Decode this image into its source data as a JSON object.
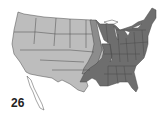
{
  "map": {
    "label": "26",
    "region": "Contiguous United States",
    "legend_colors": {
      "highlighted": "#6e6e6e",
      "partial": "#8c8c8c",
      "base": "#bdbdbd",
      "outline": "#4a4a4a",
      "background": "#ffffff"
    },
    "highlighted_region": "Eastern United States (Minnesota, Wisconsin, Michigan, Iowa-east, Missouri, Arkansas, Louisiana, eastern Texas/Oklahoma and all states east of the Mississippi except Illinois)"
  }
}
